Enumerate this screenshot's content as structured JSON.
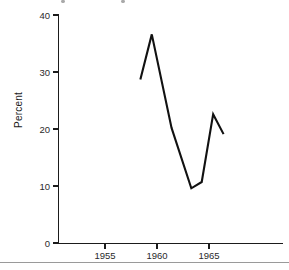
{
  "figure": {
    "background_color": "#ffffff",
    "ink_color": "#111111",
    "title_cut_off": true
  },
  "chart_data": {
    "type": "line",
    "title": "",
    "xlabel": "",
    "ylabel": "Percent",
    "xlim": [
      1951.5,
      1968.5
    ],
    "ylim": [
      0,
      40
    ],
    "grid": false,
    "legend": null,
    "yticks": [
      0,
      10,
      20,
      30,
      40
    ],
    "ytick_labels": [
      "0",
      "10",
      "20",
      "30",
      "40"
    ],
    "xticks": [
      1955,
      1960,
      1965
    ],
    "xtick_labels": [
      "1955",
      "1960",
      "1965"
    ],
    "series": [
      {
        "name": "Percent",
        "color": "#111111",
        "x": [
          1958.4,
          1959.5,
          1961.4,
          1963.3,
          1964.3,
          1965.4,
          1966.4
        ],
        "values": [
          28.7,
          36.6,
          20.2,
          9.6,
          10.7,
          22.6,
          19.1
        ],
        "points": [
          {
            "x": 1958.4,
            "y": 28.7
          },
          {
            "x": 1959.5,
            "y": 36.6
          },
          {
            "x": 1961.4,
            "y": 20.2
          },
          {
            "x": 1963.3,
            "y": 9.6
          },
          {
            "x": 1964.3,
            "y": 10.7
          },
          {
            "x": 1965.4,
            "y": 22.6
          },
          {
            "x": 1966.4,
            "y": 19.1
          }
        ]
      }
    ]
  },
  "axes": {
    "y_axis_title": "Percent",
    "y_tick_labels": [
      "40",
      "30",
      "20",
      "10",
      "0"
    ],
    "x_tick_labels": [
      "1955",
      "1960",
      "1965"
    ]
  },
  "icons": {
    "y_axis_label": "vertical-axis-title",
    "plot_line": "data-line-series"
  }
}
